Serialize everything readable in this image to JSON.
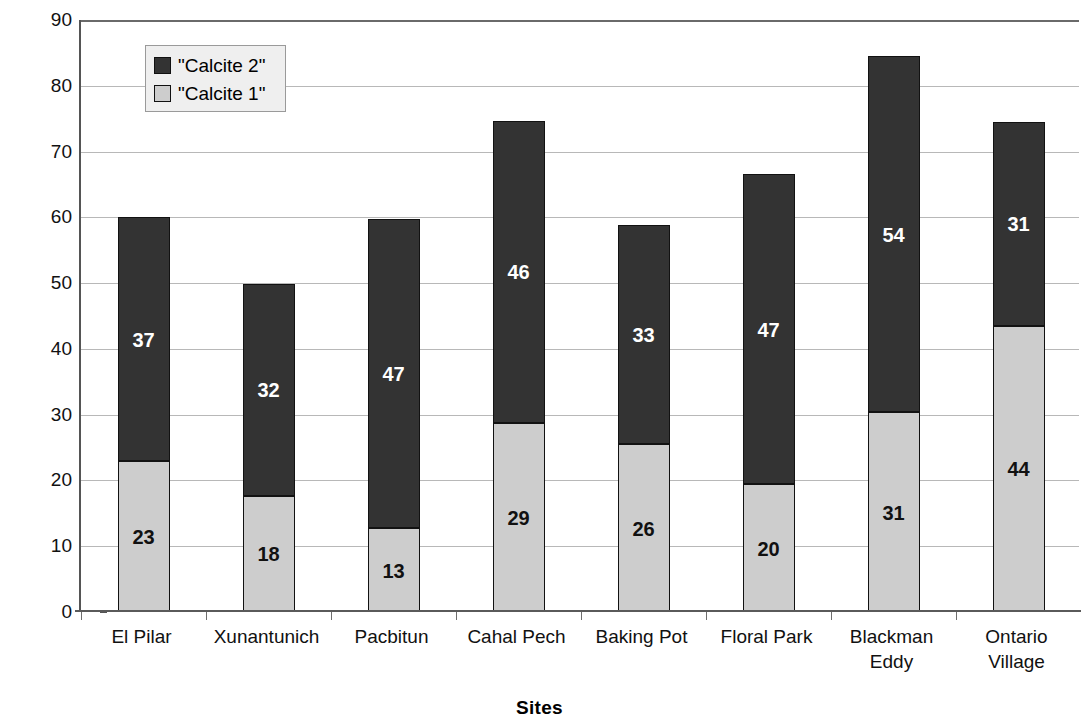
{
  "chart_data": {
    "type": "bar",
    "subtype": "stacked-bar",
    "title": "",
    "xlabel": "Sites",
    "ylabel": "% of Total Assemblage",
    "ylim": [
      0,
      90
    ],
    "ytick_step": 10,
    "yticks": [
      0,
      10,
      20,
      30,
      40,
      50,
      60,
      70,
      80,
      90
    ],
    "grid": true,
    "grid_axis": "y",
    "legend_position": "upper-left-inside",
    "categories": [
      "El Pilar",
      "Xunantunich",
      "Pacbitun",
      "Cahal Pech",
      "Baking Pot",
      "Floral Park",
      "Blackman Eddy",
      "Ontario Village"
    ],
    "category_lines": [
      [
        "El Pilar"
      ],
      [
        "Xunantunich"
      ],
      [
        "Pacbitun"
      ],
      [
        "Cahal Pech"
      ],
      [
        "Baking Pot"
      ],
      [
        "Floral Park"
      ],
      [
        "Blackman",
        "Eddy"
      ],
      [
        "Ontario",
        "Village"
      ]
    ],
    "series": [
      {
        "name": "\"Calcite 1\"",
        "color": "#cdcdcd",
        "label_color": "#111111",
        "values": [
          23,
          18,
          13,
          29,
          26,
          20,
          31,
          44
        ],
        "plotted_values": [
          22.9,
          17.7,
          12.7,
          28.7,
          25.5,
          19.4,
          30.4,
          43.5
        ],
        "labels": [
          "23",
          "18",
          "13",
          "29",
          "26",
          "20",
          "31",
          "44"
        ]
      },
      {
        "name": "\"Calcite 2\"",
        "color": "#333333",
        "label_color": "#ffffff",
        "values": [
          37,
          32,
          47,
          46,
          33,
          47,
          54,
          31
        ],
        "plotted_values": [
          37.1,
          32.2,
          47.1,
          46.0,
          33.3,
          47.2,
          54.1,
          31.0
        ],
        "labels": [
          "37",
          "32",
          "47",
          "46",
          "33",
          "47",
          "54",
          "31"
        ]
      }
    ],
    "totals": [
      60.0,
      49.9,
      59.8,
      74.7,
      58.8,
      66.5,
      84.5,
      74.5
    ],
    "legend_entries": [
      {
        "label": "\"Calcite 2\"",
        "swatch": "dark"
      },
      {
        "label": "\"Calcite 1\"",
        "swatch": "light"
      }
    ]
  }
}
